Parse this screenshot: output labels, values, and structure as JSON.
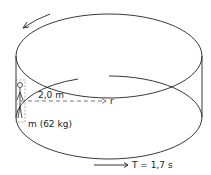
{
  "diagram": {
    "type": "rotating-cylinder",
    "labels": {
      "radius": "2,0 m",
      "axis": "r",
      "mass": "m (62 kg)",
      "period": "T = 1,7 s"
    },
    "icons": {
      "rotation_arrow": "curved-arrow-icon",
      "period_arrow": "right-arrow-icon",
      "person": "stick-figure-icon"
    },
    "colors": {
      "stroke": "#222222",
      "dashed": "#555555",
      "background": "#ffffff"
    }
  }
}
